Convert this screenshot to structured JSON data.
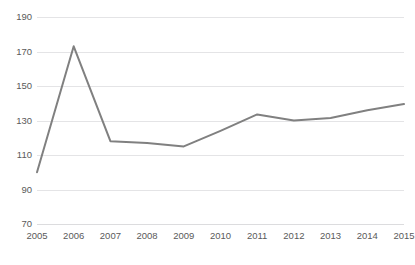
{
  "chart_data": {
    "type": "line",
    "title": "",
    "title_clipped": true,
    "subtitle": "",
    "xlabel": "",
    "ylabel": "",
    "categories": [
      "2005",
      "2006",
      "2007",
      "2008",
      "2009",
      "2010",
      "2011",
      "2012",
      "2013",
      "2014",
      "2015"
    ],
    "x": [
      2005,
      2006,
      2007,
      2008,
      2009,
      2010,
      2011,
      2012,
      2013,
      2014,
      2015
    ],
    "values": [
      100,
      173,
      118,
      117,
      115,
      124,
      133.5,
      130,
      131.5,
      136,
      139.5
    ],
    "series": [
      {
        "name": "",
        "values": [
          100,
          173,
          118,
          117,
          115,
          124,
          133.5,
          130,
          131.5,
          136,
          139.5
        ],
        "color": "#808080",
        "line_width": 2,
        "markers": false
      }
    ],
    "ylim": [
      70,
      190
    ],
    "yticks": [
      70,
      90,
      110,
      130,
      150,
      170,
      190
    ],
    "ytick_labels": [
      "70",
      "90",
      "110",
      "130",
      "150",
      "170",
      "190"
    ],
    "xtick_labels": [
      "2005",
      "2006",
      "2007",
      "2008",
      "2009",
      "2010",
      "2011",
      "2012",
      "2013",
      "2014",
      "2015"
    ],
    "grid": {
      "horizontal": true,
      "vertical": false,
      "color": "#e4e4e6"
    },
    "legend": {
      "visible": false,
      "position": "none",
      "entries": []
    },
    "annotations": [],
    "background_color": "#ffffff",
    "axis_label_color": "#5a5a5a"
  }
}
